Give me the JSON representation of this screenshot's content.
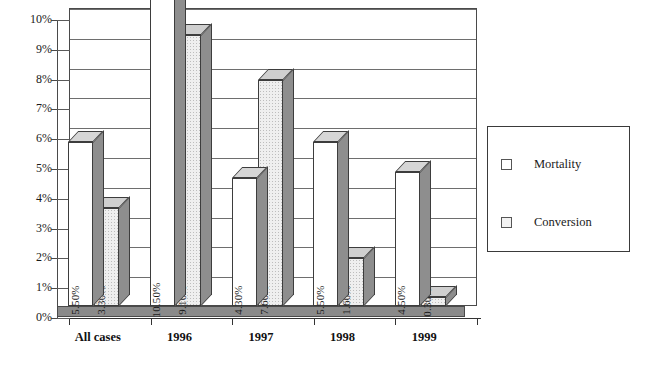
{
  "chart_data": {
    "type": "bar",
    "title": "",
    "subtitle": "",
    "xlabel": "",
    "ylabel": "",
    "categories": [
      "All cases",
      "1996",
      "1997",
      "1998",
      "1999"
    ],
    "series": [
      {
        "name": "Mortality",
        "values": [
          5.5,
          10.5,
          4.3,
          5.5,
          4.5
        ],
        "labels": [
          "5.50%",
          "10.50%",
          "4.30%",
          "5.50%",
          "4.50%"
        ],
        "swatch": "white"
      },
      {
        "name": "Conversion",
        "values": [
          3.3,
          9.1,
          7.6,
          1.6,
          0.3
        ],
        "labels": [
          "3.30%",
          "9.10%",
          "7.60%",
          "1.60%",
          "0.30%"
        ],
        "swatch": "light-gray-dotted"
      }
    ],
    "ylim": [
      0,
      10
    ],
    "ytick_values": [
      0,
      1,
      2,
      3,
      4,
      5,
      6,
      7,
      8,
      9,
      10
    ],
    "ytick_labels": [
      "0%",
      "1%",
      "2%",
      "3%",
      "4%",
      "5%",
      "6%",
      "7%",
      "8%",
      "9%",
      "10%"
    ],
    "grid": true,
    "grid_axis": "y",
    "legend_position": "right",
    "style": "3d-clustered-column",
    "value_labels_rotation_deg": -90,
    "colors": {
      "mortality_face": "#ffffff",
      "conversion_face": "#efefef",
      "bar_side": "#8e8e8e",
      "bar_top": "#d6d6d6",
      "outline": "#3d3d3d",
      "gridline": "#6e6e6e",
      "floor": "#8a8a8a",
      "background": "#ffffff",
      "text": "#1a1a1a"
    }
  },
  "legend": {
    "entries": [
      {
        "label": "Mortality"
      },
      {
        "label": "Conversion"
      }
    ]
  }
}
